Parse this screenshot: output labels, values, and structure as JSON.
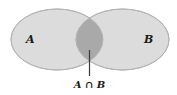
{
  "diagram": {
    "type": "venn",
    "sets": [
      {
        "id": "A",
        "label": "A",
        "cx": 57,
        "cy": 39.5,
        "rx": 46,
        "ry": 30.5
      },
      {
        "id": "B",
        "label": "B",
        "cx": 122.5,
        "cy": 39.5,
        "rx": 46.5,
        "ry": 30.5
      }
    ],
    "intersection": {
      "label": "A ∩ B"
    },
    "colors": {
      "background": "#ffffff",
      "set_fill": "#dcdcdc",
      "set_stroke": "#b4b4b4",
      "intersection_fill": "#a9a9a9",
      "leader_line": "#3a3a3a",
      "text": "#1a1a1a"
    }
  }
}
